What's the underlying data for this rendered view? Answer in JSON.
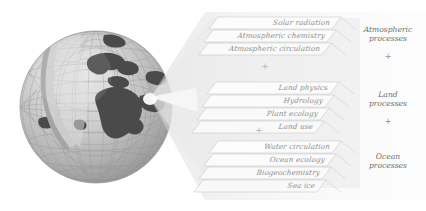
{
  "figure": {
    "title_visible": false,
    "globe": {
      "icon": "earth-globe-wireframe",
      "description": "Grayscale 3D wireframe globe with dark continents and a cut-away wedge",
      "colors": {
        "sphere_light": "#d8d8d8",
        "sphere_mid": "#b9b9b9",
        "sphere_dark": "#9a9a9a",
        "grid": "#8a8a8a",
        "land": "#4a4a4a",
        "wedge": "#f2f2f2"
      }
    },
    "beam": {
      "icon": "light-cone",
      "color": "#e6e6e6"
    },
    "groups": [
      {
        "id": "atmospheric",
        "label": "Atmospheric\nprocesses",
        "label_line1": "Atmospheric",
        "label_line2": "processes",
        "separator_after": "+",
        "panels": [
          {
            "label": "Solar radiation"
          },
          {
            "label": "Atmospheric chemistry"
          },
          {
            "label": "Atmospheric circulation"
          }
        ]
      },
      {
        "id": "land",
        "label": "Land\nprocesses",
        "label_line1": "Land",
        "label_line2": "processes",
        "separator_after": "+",
        "panels": [
          {
            "label": "Land physics"
          },
          {
            "label": "Hydrology"
          },
          {
            "label": "Plant ecology"
          },
          {
            "label": "Land use"
          }
        ]
      },
      {
        "id": "ocean",
        "label": "Ocean\nprocesses",
        "label_line1": "Ocean",
        "label_line2": "processes",
        "separator_after": "",
        "panels": [
          {
            "label": "Water circulation"
          },
          {
            "label": "Ocean ecology"
          },
          {
            "label": "Biogeochemistry"
          },
          {
            "label": "Sea ice"
          }
        ]
      }
    ],
    "separators": {
      "stack_plus_1": "+",
      "stack_plus_2": "+",
      "group_plus_1": "+",
      "group_plus_2": "+"
    },
    "palette": {
      "panel_fill": "#fbfbfb",
      "panel_stroke": "#c9c9c9",
      "text_gray": "#8e8e8e",
      "label_gray": "#6f6f6f",
      "background": "#ffffff"
    }
  }
}
